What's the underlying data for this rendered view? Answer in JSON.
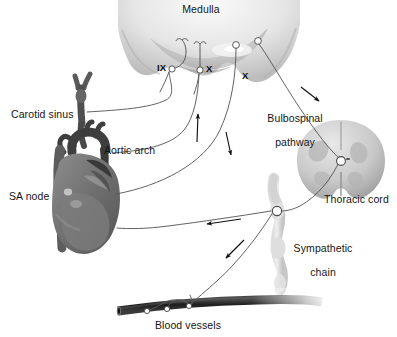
{
  "figure": {
    "background_color": "#ffffff",
    "line_color": "#4a4a4a",
    "text_color": "#151515",
    "vessel_color": "#2b2b2b"
  },
  "labels": {
    "medulla": "Medulla",
    "carotid_sinus": "Carotid sinus",
    "aortic_arch": "Aortic arch",
    "sa_node": "SA node",
    "bulbospinal_line1": "Bulbospinal",
    "bulbospinal_line2": "pathway",
    "thoracic_cord": "Thoracic cord",
    "sympathetic_line1": "Sympathetic",
    "sympathetic_line2": "chain",
    "blood_vessels": "Blood vessels"
  },
  "nerve_tags": [
    {
      "name": "glossopharyngeal",
      "text": "IX"
    },
    {
      "name": "vagus-left",
      "text": "X"
    },
    {
      "name": "vagus-right",
      "text": "X"
    }
  ],
  "structures": [
    {
      "name": "medulla",
      "label": "Medulla",
      "type": "brainstem-section"
    },
    {
      "name": "thoracic-cord",
      "label": "Thoracic cord",
      "type": "spinal-cord-cross-section"
    },
    {
      "name": "heart",
      "label": "SA node",
      "type": "heart-illustration"
    },
    {
      "name": "carotid-artery",
      "label": "Carotid sinus",
      "type": "artery-bifurcation"
    },
    {
      "name": "sympathetic-chain",
      "label": "Sympathetic chain",
      "type": "ganglion-chain"
    },
    {
      "name": "blood-vessel",
      "label": "Blood vessels",
      "type": "vessel-tube"
    }
  ],
  "pathways": [
    {
      "name": "carotid-afferent",
      "from": "Carotid sinus",
      "to": "Medulla",
      "direction": "afferent"
    },
    {
      "name": "aortic-afferent",
      "from": "Aortic arch",
      "to": "Medulla",
      "direction": "afferent"
    },
    {
      "name": "vagal-efferent",
      "from": "Medulla",
      "to": "SA node",
      "direction": "efferent"
    },
    {
      "name": "bulbospinal-pathway",
      "from": "Medulla",
      "to": "Thoracic cord",
      "direction": "efferent"
    },
    {
      "name": "sympathetic-cardiac",
      "from": "Sympathetic chain",
      "to": "SA node",
      "direction": "efferent"
    },
    {
      "name": "sympathetic-vascular",
      "from": "Sympathetic chain",
      "to": "Blood vessels",
      "direction": "efferent"
    }
  ]
}
